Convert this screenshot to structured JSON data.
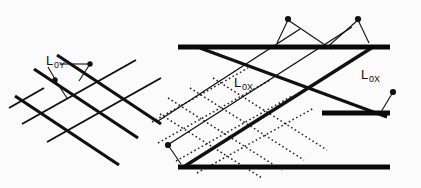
{
  "figure": {
    "background_color": "#fbfbfb",
    "ink_color": "#111111",
    "width": 421,
    "height": 188,
    "panels": [
      {
        "id": "left-panel",
        "name": "lattice-panel-y",
        "label": {
          "base": "L",
          "subscript": "0Y",
          "full": "L0Y",
          "x": 46,
          "y": 62
        },
        "description": "crossed line lattice with L0Y annotation"
      },
      {
        "id": "right-panel",
        "name": "lattice-panel-x",
        "labels": [
          {
            "base": "L",
            "subscript": "0X",
            "full": "L0X",
            "x": 234,
            "y": 84
          },
          {
            "base": "L",
            "subscript": "0X",
            "full": "L0X",
            "x": 362,
            "y": 76
          }
        ],
        "description": "banded lattice with horizontal bars, thick diagonals and dotted grid"
      }
    ]
  },
  "geometry": {
    "left_thick_lines": [
      {
        "x1": 34,
        "y1": 69,
        "x2": 138,
        "y2": 138
      },
      {
        "x1": 57,
        "y1": 55,
        "x2": 161,
        "y2": 124
      },
      {
        "x1": 15,
        "y1": 96,
        "x2": 119,
        "y2": 165
      }
    ],
    "left_thin_lines": [
      {
        "x1": 22,
        "y1": 124,
        "x2": 136,
        "y2": 60
      },
      {
        "x1": 47,
        "y1": 142,
        "x2": 161,
        "y2": 78
      },
      {
        "x1": 9,
        "y1": 108,
        "x2": 40,
        "y2": 91
      }
    ],
    "right_bars": [
      {
        "x1": 178,
        "y1": 47,
        "x2": 390,
        "y2": 47,
        "thickness": 5
      },
      {
        "x1": 322,
        "y1": 113,
        "x2": 390,
        "y2": 113,
        "thickness": 5
      },
      {
        "x1": 178,
        "y1": 167,
        "x2": 390,
        "y2": 167,
        "thickness": 5
      }
    ],
    "right_thick_diagonals": [
      {
        "x1": 200,
        "y1": 47,
        "x2": 386,
        "y2": 116
      },
      {
        "x1": 186,
        "y1": 166,
        "x2": 372,
        "y2": 47
      }
    ],
    "right_thin_diagonals": [
      {
        "x1": 166,
        "y1": 146,
        "x2": 352,
        "y2": 27
      },
      {
        "x1": 158,
        "y1": 120,
        "x2": 300,
        "y2": 28
      }
    ],
    "right_dotted_down": [
      {
        "x1": 168,
        "y1": 98,
        "x2": 280,
        "y2": 168
      },
      {
        "x1": 190,
        "y1": 88,
        "x2": 302,
        "y2": 158
      },
      {
        "x1": 212,
        "y1": 78,
        "x2": 324,
        "y2": 148
      },
      {
        "x1": 160,
        "y1": 114,
        "x2": 258,
        "y2": 176
      }
    ],
    "right_dotted_up": [
      {
        "x1": 158,
        "y1": 142,
        "x2": 268,
        "y2": 80
      },
      {
        "x1": 176,
        "y1": 160,
        "x2": 290,
        "y2": 96
      },
      {
        "x1": 196,
        "y1": 172,
        "x2": 312,
        "y2": 108
      },
      {
        "x1": 152,
        "y1": 122,
        "x2": 246,
        "y2": 68
      }
    ],
    "dots": [
      {
        "name": "left-dot-upper",
        "cx": 90,
        "cy": 64,
        "r": 2.6
      },
      {
        "name": "left-dot-lower",
        "cx": 55,
        "cy": 80,
        "r": 2.6
      },
      {
        "name": "right-dot-top-left",
        "cx": 288,
        "cy": 19,
        "r": 3.0
      },
      {
        "name": "right-dot-top-right",
        "cx": 358,
        "cy": 19,
        "r": 3.0
      },
      {
        "name": "right-dot-left",
        "cx": 168,
        "cy": 145,
        "r": 3.0
      },
      {
        "name": "right-dot-right",
        "cx": 393,
        "cy": 92,
        "r": 3.0
      }
    ],
    "leaders": [
      {
        "name": "leader-left-a",
        "x1": 90,
        "y1": 64,
        "x2": 79,
        "y2": 80
      },
      {
        "name": "leader-left-b",
        "x1": 55,
        "y1": 80,
        "x2": 66,
        "y2": 97
      },
      {
        "name": "leader-left-label-a",
        "x1": 60,
        "y1": 64,
        "x2": 90,
        "y2": 64
      },
      {
        "name": "leader-left-label-b",
        "x1": 46,
        "y1": 66,
        "x2": 55,
        "y2": 80
      },
      {
        "name": "leader-top-left",
        "x1": 288,
        "y1": 19,
        "x2": 278,
        "y2": 42
      },
      {
        "name": "leader-top-left-long",
        "x1": 288,
        "y1": 19,
        "x2": 330,
        "y2": 48
      },
      {
        "name": "leader-top-right",
        "x1": 358,
        "y1": 19,
        "x2": 368,
        "y2": 42
      },
      {
        "name": "leader-top-right-long",
        "x1": 358,
        "y1": 19,
        "x2": 326,
        "y2": 48
      },
      {
        "name": "leader-right-dot",
        "x1": 393,
        "y1": 92,
        "x2": 381,
        "y2": 111
      },
      {
        "name": "leader-left-dot",
        "x1": 168,
        "y1": 145,
        "x2": 180,
        "y2": 163
      },
      {
        "name": "leader-label-x-left",
        "x1": 240,
        "y1": 86,
        "x2": 232,
        "y2": 96
      },
      {
        "name": "leader-label-x-right",
        "x1": 366,
        "y1": 78,
        "x2": 390,
        "y2": 91
      }
    ]
  }
}
